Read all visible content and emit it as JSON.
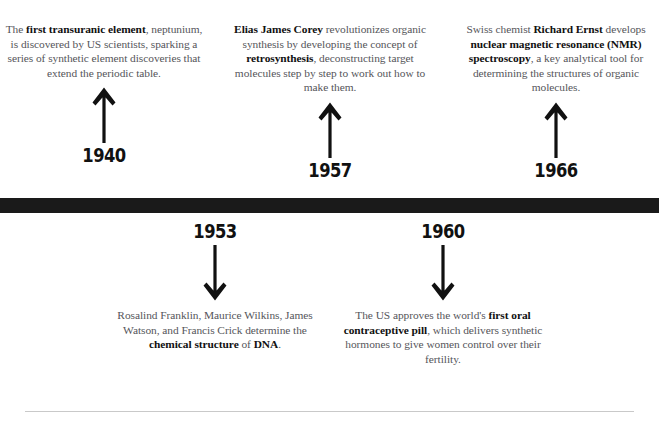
{
  "timeline": {
    "bar_color": "#1a1a1a",
    "text_color": "#55555a",
    "bold_color": "#111111",
    "rule_color": "#c9c9c9",
    "events_above": [
      {
        "year": "1940",
        "arrow": "arrow-up-icon",
        "text_html": "The <b>first transuranic element</b>, neptunium, is discovered by US scientists, sparking a series of synthetic element discoveries that extend the periodic table.",
        "text_plain": "The first transuranic element, neptunium, is discovered by US scientists, sparking a series of synthetic element discoveries that extend the periodic table."
      },
      {
        "year": "1957",
        "arrow": "arrow-up-icon",
        "text_html": "<b>Elias James Corey</b> revolutionizes organic synthesis by developing the concept of <b>retrosynthesis</b>, deconstructing target molecules step by step to work out how to make them.",
        "text_plain": "Elias James Corey revolutionizes organic synthesis by developing the concept of retrosynthesis, deconstructing target molecules step by step to work out how to make them."
      },
      {
        "year": "1966",
        "arrow": "arrow-up-icon",
        "text_html": "Swiss chemist <b>Richard Ernst</b> develops <b>nuclear magnetic resonance (NMR) spectroscopy</b>, a key analytical tool for determining the structures of organic molecules.",
        "text_plain": "Swiss chemist Richard Ernst develops nuclear magnetic resonance (NMR) spectroscopy, a key analytical tool for determining the structures of organic molecules."
      }
    ],
    "events_below": [
      {
        "year": "1953",
        "arrow": "arrow-down-icon",
        "text_html": "Rosalind Franklin, Maurice Wilkins, James Watson, and Francis Crick determine the <b>chemical structure</b> of <b>DNA</b>.",
        "text_plain": "Rosalind Franklin, Maurice Wilkins, James Watson, and Francis Crick determine the chemical structure of DNA."
      },
      {
        "year": "1960",
        "arrow": "arrow-down-icon",
        "text_html": "The US approves the world's <b>first oral contraceptive pill</b>, which delivers synthetic hormones to give women control over their fertility.",
        "text_plain": "The US approves the world's first oral contraceptive pill, which delivers synthetic hormones to give women control over their fertility."
      }
    ]
  }
}
